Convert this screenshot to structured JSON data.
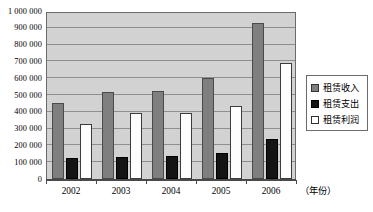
{
  "chart_data": {
    "type": "bar",
    "title": "",
    "subtitle": "",
    "xlabel": "（年份）",
    "ylabel": "",
    "categories": [
      "2002",
      "2003",
      "2004",
      "2005",
      "2006"
    ],
    "series": [
      {
        "name": "租赁收入",
        "values": [
          450000,
          520000,
          525000,
          600000,
          930000
        ],
        "color": "#7f7f7f"
      },
      {
        "name": "租赁支出",
        "values": [
          125000,
          130000,
          135000,
          155000,
          240000
        ],
        "color": "#141414"
      },
      {
        "name": "租赁利润",
        "values": [
          325000,
          390000,
          390000,
          435000,
          690000
        ],
        "color": "#ffffff"
      }
    ],
    "ylim": [
      0,
      1000000
    ],
    "ytick_step": 100000,
    "ytick_labels": [
      "1 000 000",
      "900 000",
      "800 000",
      "700 000",
      "600 000",
      "500 000",
      "400 000",
      "300 000",
      "200 000",
      "100 000",
      "0"
    ],
    "grid": true,
    "legend_position": "right",
    "plot_background": "#d2d2d2",
    "gridline_color": "#8f8f8f",
    "axis_color": "#4a4a4a"
  },
  "legend": {
    "items": [
      {
        "label": "租赁收入",
        "swatch": "income-swatch"
      },
      {
        "label": "租赁支出",
        "swatch": "expense-swatch"
      },
      {
        "label": "租赁利润",
        "swatch": "profit-swatch"
      }
    ]
  }
}
